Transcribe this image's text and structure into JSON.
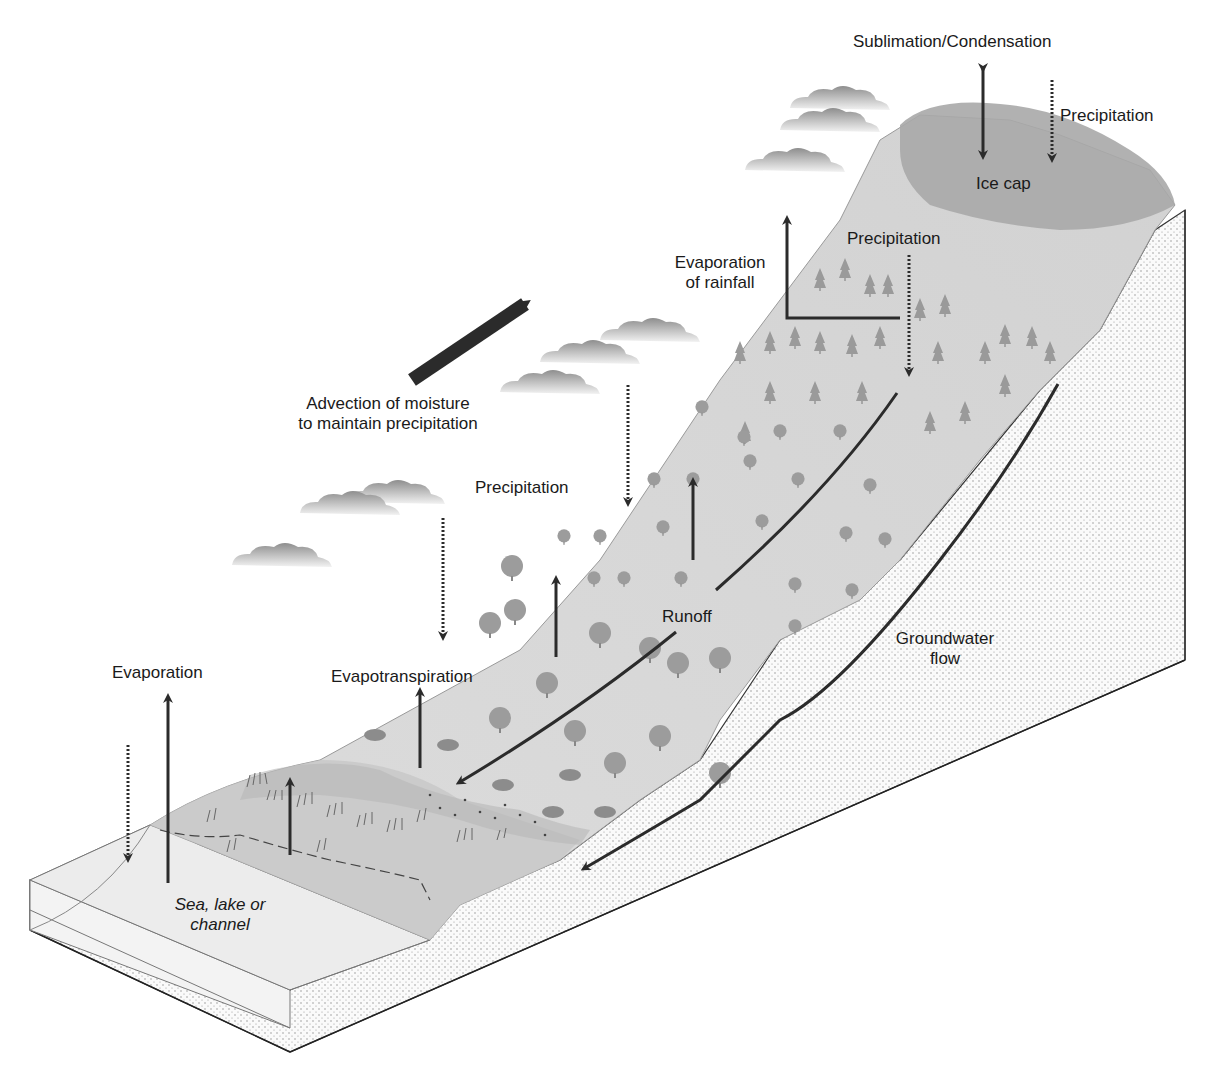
{
  "diagram": {
    "colors": {
      "ice_cap": "#a8a8a8",
      "vegetated_slope": "#d8d8d8",
      "upper_slope": "#cdcdcd",
      "wetland": "#c4c4c4",
      "water_body": "#eeeeee",
      "soil": "#f7f7f7",
      "stipple": "#8a8a8a",
      "arrow": "#2b2b2b",
      "tree": "#9a9a9a",
      "cloud": "#b5b5b5"
    },
    "labels": {
      "sublimation": "Sublimation/Condensation",
      "precip_icecap": "Precipitation",
      "ice_cap": "Ice cap",
      "precip_upper": "Precipitation",
      "evap_rainfall_1": "Evaporation",
      "evap_rainfall_2": "of rainfall",
      "advection_1": "Advection of moisture",
      "advection_2": "to maintain precipitation",
      "precip_mid": "Precipitation",
      "runoff": "Runoff",
      "groundwater_1": "Groundwater",
      "groundwater_2": "flow",
      "evaporation": "Evaporation",
      "evapotranspiration": "Evapotranspiration",
      "water_body_1": "Sea, lake or",
      "water_body_2": "channel"
    },
    "flows": [
      {
        "name": "Sublimation/Condensation",
        "type": "bidirectional",
        "style": "solid"
      },
      {
        "name": "Precipitation (ice cap)",
        "type": "downward",
        "style": "dotted"
      },
      {
        "name": "Precipitation (upper slope)",
        "type": "downward",
        "style": "dotted"
      },
      {
        "name": "Evaporation of rainfall",
        "type": "upward",
        "style": "solid"
      },
      {
        "name": "Advection of moisture",
        "type": "diagonal",
        "style": "bold"
      },
      {
        "name": "Precipitation (mid slope)",
        "type": "downward",
        "style": "dotted"
      },
      {
        "name": "Runoff",
        "type": "downslope",
        "style": "solid"
      },
      {
        "name": "Groundwater flow",
        "type": "subsurface",
        "style": "solid"
      },
      {
        "name": "Evapotranspiration",
        "type": "upward",
        "style": "solid"
      },
      {
        "name": "Evaporation",
        "type": "upward",
        "style": "solid"
      }
    ]
  }
}
